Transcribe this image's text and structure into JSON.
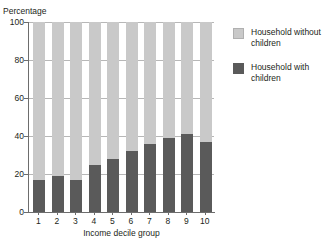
{
  "chart_data": {
    "type": "bar",
    "stacked": true,
    "title": "",
    "xlabel": "Income decile group",
    "ylabel": "Percentage",
    "categories": [
      "1",
      "2",
      "3",
      "4",
      "5",
      "6",
      "7",
      "8",
      "9",
      "10"
    ],
    "series": [
      {
        "name": "Household with children",
        "color": "#5a5a5a",
        "values": [
          17,
          19,
          17,
          25,
          28,
          32,
          36,
          39,
          41,
          37
        ]
      },
      {
        "name": "Household without children",
        "color": "#c9c9c9",
        "values": [
          83,
          81,
          83,
          75,
          72,
          68,
          64,
          61,
          59,
          63
        ]
      }
    ],
    "ylim": [
      0,
      100
    ],
    "yticks": [
      "0",
      "20",
      "40",
      "60",
      "80",
      "100"
    ],
    "grid": true,
    "legend_position": "right"
  },
  "legend": {
    "items": [
      {
        "label": "Household without children",
        "swatch": "light"
      },
      {
        "label": "Household with children",
        "swatch": "dark"
      }
    ]
  },
  "axes": {
    "y_title": "Percentage",
    "x_title": "Income decile group"
  },
  "colors": {
    "light_gray": "#c9c9c9",
    "dark_gray": "#5a5a5a",
    "gridline": "#b7b7b7",
    "axis": "#6d6d6d",
    "text": "#231f20"
  }
}
